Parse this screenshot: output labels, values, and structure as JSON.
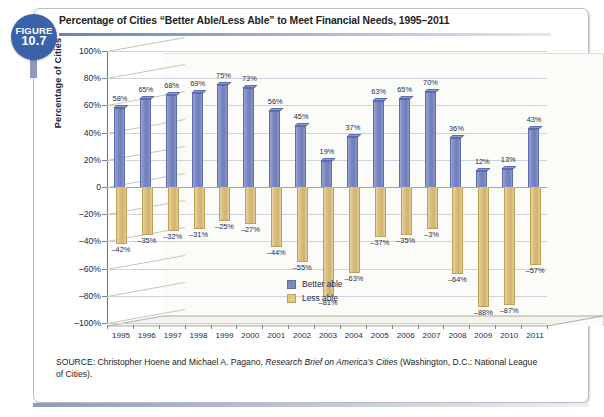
{
  "figure": {
    "badge_top": "FIGURE",
    "badge_number": "10.7",
    "title": "Percentage of Cities “Better Able/Less Able” to Meet Financial Needs, 1995–2011"
  },
  "source": {
    "prefix": "SOURCE: Christopher Hoene and Michael A. Pagano, ",
    "italic": "Research Brief on America’s Cities",
    "suffix": " (Washington, D.C.: National League of Cities)."
  },
  "legend": {
    "items": [
      {
        "label": "Better able",
        "color": "#7b88c4"
      },
      {
        "label": "Less able",
        "color": "#e0c98c"
      }
    ]
  },
  "colors": {
    "better_able": "#7b88c4",
    "less_able": "#e0c98c",
    "badge": "#3a62ab",
    "axis_text": "#1b2a4a",
    "gridline": "#cfd3dd"
  },
  "chart_data": {
    "type": "bar",
    "title": "Percentage of Cities “Better Able/Less Able” to Meet Financial Needs, 1995–2011",
    "xlabel": "",
    "ylabel": "Percentage of Cities",
    "ylim": [
      -100,
      100
    ],
    "ytick_values": [
      100,
      80,
      60,
      40,
      20,
      0,
      -20,
      -40,
      -60,
      -80,
      -100
    ],
    "ytick_labels": [
      "100%",
      "80%",
      "60%",
      "40%",
      "20%",
      "0",
      "–20%",
      "–40%",
      "–60%",
      "–80%",
      "–100%"
    ],
    "grid": true,
    "legend_position": "inside-center-lower",
    "categories": [
      "1995",
      "1996",
      "1997",
      "1998",
      "1999",
      "2000",
      "2001",
      "2002",
      "2003",
      "2004",
      "2005",
      "2006",
      "2007",
      "2008",
      "2009",
      "2010",
      "2011"
    ],
    "series": [
      {
        "name": "Better able",
        "color": "#7b88c4",
        "values": [
          58,
          65,
          68,
          69,
          75,
          73,
          56,
          45,
          19,
          37,
          63,
          65,
          70,
          36,
          12,
          13,
          43
        ],
        "labels": [
          "58%",
          "65%",
          "68%",
          "69%",
          "75%",
          "73%",
          "56%",
          "45%",
          "19%",
          "37%",
          "63%",
          "65%",
          "70%",
          "36%",
          "12%",
          "13%",
          "43%"
        ]
      },
      {
        "name": "Less able",
        "color": "#e0c98c",
        "values": [
          -42,
          -35,
          -32,
          -31,
          -25,
          -27,
          -44,
          -55,
          -81,
          -63,
          -37,
          -35,
          -31,
          -64,
          -88,
          -87,
          -57
        ],
        "labels": [
          "–42%",
          "–35%",
          "–32%",
          "–31%",
          "–25%",
          "–27%",
          "–44%",
          "–55%",
          "–81%",
          "–63%",
          "–37%",
          "–35%",
          "–3%",
          "–64%",
          "–88%",
          "–87%",
          "–57%"
        ]
      }
    ]
  }
}
